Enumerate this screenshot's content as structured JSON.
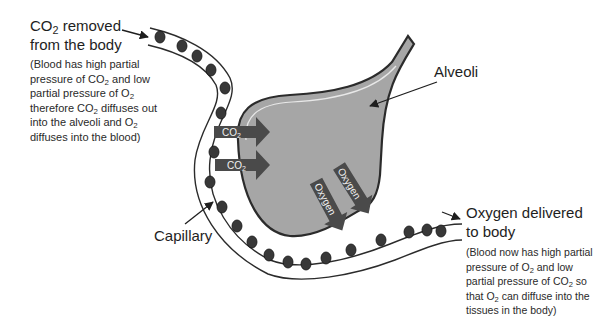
{
  "diagram": {
    "colors": {
      "alveolus_fill": "#a6a6a6",
      "outline": "#2b2b2b",
      "arrow_fill": "#4a4a4a",
      "rbc_fill": "#3a3a3a",
      "background": "#ffffff"
    }
  },
  "labels": {
    "co2_removed": {
      "title_line1_pre": "CO",
      "title_line1_sub": "2",
      "title_line1_post": " removed",
      "title_line2": "from the body",
      "note": [
        {
          "pre": "(Blood has high partial",
          "sub": "",
          "post": ""
        },
        {
          "pre": "pressure of CO",
          "sub": "2",
          "post": " and low"
        },
        {
          "pre": "partial pressure of O",
          "sub": "2",
          "post": ""
        },
        {
          "pre": "therefore CO",
          "sub": "2",
          "post": " diffuses out"
        },
        {
          "pre": "into the alveoli and O",
          "sub": "2",
          "post": ""
        },
        {
          "pre": "diffuses into the blood)",
          "sub": "",
          "post": ""
        }
      ]
    },
    "alveoli": "Alveoli",
    "capillary": "Capillary",
    "oxygen_delivered": {
      "title_line1": "Oxygen delivered",
      "title_line2": "to body",
      "note": [
        {
          "pre": "(Blood now has high partial",
          "sub": "",
          "post": ""
        },
        {
          "pre": "pressure of O",
          "sub": "2",
          "post": " and low"
        },
        {
          "pre": "partial pressure of CO",
          "sub": "2",
          "post": " so"
        },
        {
          "pre": "that O",
          "sub": "2",
          "post": " can diffuse into the"
        },
        {
          "pre": "tissues in the body)",
          "sub": "",
          "post": ""
        }
      ]
    }
  },
  "arrows": {
    "co2_top": {
      "pre": "CO",
      "sub": "2"
    },
    "co2_bottom": {
      "pre": "CO",
      "sub": "2"
    },
    "oxygen_left": "Oxygen",
    "oxygen_right": "Oxygen"
  }
}
